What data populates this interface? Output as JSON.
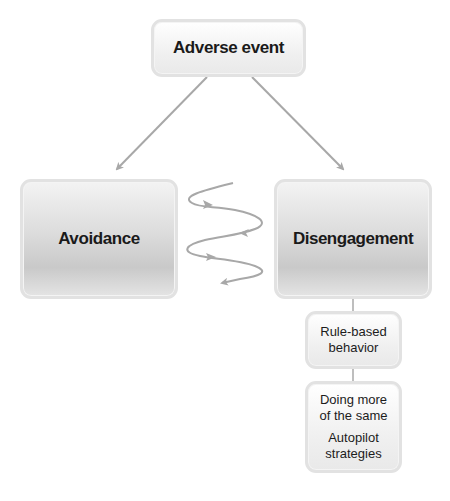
{
  "diagram": {
    "top": {
      "label": "Adverse event"
    },
    "left": {
      "label": "Avoidance"
    },
    "right": {
      "label": "Disengagement"
    },
    "sub1": {
      "line1": "Rule-based",
      "line2": "behavior"
    },
    "sub2": {
      "group1": {
        "line1": "Doing more",
        "line2": "of the same"
      },
      "group2": {
        "line1": "Autopilot",
        "line2": "strategies"
      }
    }
  },
  "colors": {
    "arrow": "#a8a8a8",
    "box_border": "#e2e2e2",
    "text": "#1a1a1a"
  }
}
